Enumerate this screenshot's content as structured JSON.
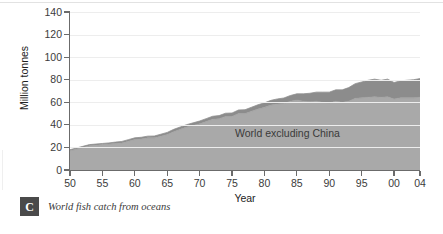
{
  "caption": {
    "badge_letter": "C",
    "text": "World fish catch from oceans",
    "badge_icon": "chevron-roof-icon"
  },
  "chart_data": {
    "type": "area",
    "title": "",
    "subtitle": "",
    "xlabel": "Year",
    "ylabel": "Million tonnes",
    "xlim": [
      50,
      104
    ],
    "ylim": [
      0,
      140
    ],
    "grid": true,
    "stacked": true,
    "legend_position": "inline-annotation",
    "colors": {
      "world_excluding_china": "#a9a9a9",
      "china": "#8c8c8c",
      "outline": "#8f8f8f",
      "axis": "#6b6b6b",
      "gridline": "#ededed",
      "text": "#3b3b3b",
      "china_label_text": "#ffffff"
    },
    "ytick_labels": [
      "0",
      "20",
      "40",
      "60",
      "80",
      "100",
      "120",
      "140"
    ],
    "ytick_values": [
      0,
      20,
      40,
      60,
      80,
      100,
      120,
      140
    ],
    "xtick_labels": [
      "50",
      "55",
      "60",
      "65",
      "70",
      "75",
      "80",
      "85",
      "90",
      "95",
      "00",
      "04"
    ],
    "xtick_values": [
      50,
      55,
      60,
      65,
      70,
      75,
      80,
      85,
      90,
      95,
      100,
      104
    ],
    "x": [
      50,
      51,
      52,
      53,
      54,
      55,
      56,
      57,
      58,
      59,
      60,
      61,
      62,
      63,
      64,
      65,
      66,
      67,
      68,
      69,
      70,
      71,
      72,
      73,
      74,
      75,
      76,
      77,
      78,
      79,
      80,
      81,
      82,
      83,
      84,
      85,
      86,
      87,
      88,
      89,
      90,
      91,
      92,
      93,
      94,
      95,
      96,
      97,
      98,
      99,
      100,
      101,
      102,
      103,
      104
    ],
    "series": [
      {
        "name": "World excluding China",
        "values": [
          17,
          18.5,
          20,
          21.5,
          22,
          22.5,
          23,
          23.5,
          24,
          25.5,
          27,
          27.5,
          28.5,
          28.5,
          30,
          31.5,
          34,
          36,
          38,
          39.5,
          41,
          43,
          45,
          45.5,
          47.5,
          47.5,
          50,
          50,
          52,
          54,
          55.5,
          57.5,
          58.5,
          59,
          61,
          62,
          61,
          60.5,
          61,
          60,
          59.5,
          61,
          60,
          61,
          63.5,
          64,
          64.5,
          65,
          64.5,
          65,
          63,
          64,
          64,
          64,
          64.5
        ],
        "annotation": "World excluding China"
      },
      {
        "name": "China",
        "values": [
          1,
          1,
          1,
          1,
          1,
          1,
          1,
          1.2,
          1.3,
          1.4,
          1.5,
          1.5,
          1.5,
          1.6,
          1.7,
          1.8,
          2,
          2.1,
          2.2,
          2.3,
          2.4,
          2.5,
          2.6,
          2.7,
          2.8,
          3,
          3.2,
          3.4,
          3.6,
          3.8,
          4,
          4.2,
          4.5,
          4.8,
          5,
          5.5,
          6.5,
          7.5,
          8,
          9,
          9.5,
          10,
          11,
          12,
          13,
          14,
          15,
          15.5,
          15,
          15.5,
          14.5,
          15,
          15.5,
          16,
          16.5
        ],
        "annotation": "China"
      }
    ],
    "annotations": [
      {
        "label": "World excluding China",
        "placement": "inside-lower-band"
      },
      {
        "label": "China",
        "placement": "inside-upper-band"
      }
    ]
  }
}
